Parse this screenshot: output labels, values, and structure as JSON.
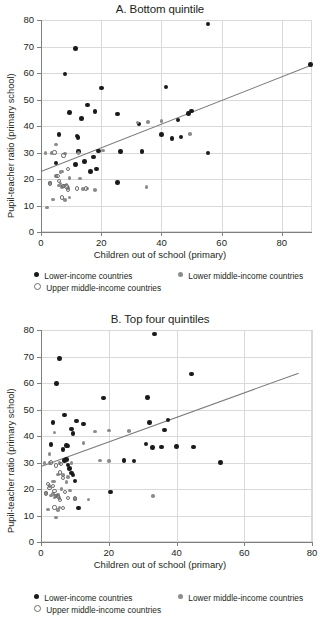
{
  "figure": {
    "legend": {
      "series": [
        {
          "key": "low",
          "label": "Lower-income countries",
          "marker": "filled-dot",
          "color": "#1a1a1a"
        },
        {
          "key": "lowmid",
          "label": "Lower middle-income countries",
          "marker": "gray-dot",
          "color": "#8c8c8c"
        },
        {
          "key": "uppermid",
          "label": "Upper middle-income countries",
          "marker": "open-circle",
          "color": "#6e6e6e"
        }
      ]
    }
  },
  "chart_data": [
    {
      "type": "scatter",
      "title": "A. Bottom quintile",
      "xlabel": "Children out of school (primary)",
      "ylabel": "Pupil-teacher ratio (primary school)",
      "xlim": [
        0,
        90
      ],
      "ylim": [
        0,
        80
      ],
      "xticks": [
        0,
        20,
        40,
        60,
        80
      ],
      "yticks": [
        0,
        10,
        20,
        30,
        40,
        50,
        60,
        70,
        80
      ],
      "grid": true,
      "legend_position": "below",
      "trendline": {
        "x0": 0,
        "y0": 23.2,
        "x1": 90,
        "y1": 63.4
      },
      "series": [
        {
          "name": "Lower-income countries",
          "color": "#1a1a1a",
          "points": [
            [
              55.5,
              78.5
            ],
            [
              11.5,
              69.3
            ],
            [
              8.0,
              59.6
            ],
            [
              20.0,
              54.3
            ],
            [
              41.5,
              54.7
            ],
            [
              89.5,
              63.3
            ],
            [
              15.5,
              48.0
            ],
            [
              9.5,
              45.2
            ],
            [
              18.0,
              45.5
            ],
            [
              25.5,
              44.5
            ],
            [
              13.5,
              42.8
            ],
            [
              32.5,
              40.8
            ],
            [
              49.0,
              44.8
            ],
            [
              50.0,
              45.7
            ],
            [
              45.5,
              42.2
            ],
            [
              6.0,
              36.8
            ],
            [
              12.0,
              36.3
            ],
            [
              12.3,
              35.6
            ],
            [
              40.0,
              36.8
            ],
            [
              43.5,
              35.3
            ],
            [
              46.5,
              35.8
            ],
            [
              55.5,
              29.8
            ],
            [
              5.0,
              26.0
            ],
            [
              11.5,
              25.5
            ],
            [
              14.5,
              26.7
            ],
            [
              17.5,
              28.3
            ],
            [
              12.5,
              30.3
            ],
            [
              19.0,
              30.5
            ],
            [
              26.5,
              30.3
            ],
            [
              33.5,
              30.3
            ],
            [
              16.5,
              22.9
            ],
            [
              18.5,
              23.7
            ],
            [
              25.5,
              18.6
            ]
          ]
        },
        {
          "name": "Lower middle-income countries",
          "color": "#8c8c8c",
          "points": [
            [
              32.0,
              41.3
            ],
            [
              35.5,
              41.6
            ],
            [
              40.0,
              41.9
            ],
            [
              49.5,
              36.9
            ],
            [
              5.0,
              33.0
            ],
            [
              1.5,
              29.9
            ],
            [
              3.5,
              29.9
            ],
            [
              8.0,
              29.6
            ],
            [
              12.5,
              29.8
            ],
            [
              20.5,
              30.8
            ],
            [
              5.0,
              21.2
            ],
            [
              6.5,
              22.7
            ],
            [
              7.0,
              22.8
            ],
            [
              9.5,
              20.4
            ],
            [
              13.0,
              20.2
            ],
            [
              3.0,
              18.5
            ],
            [
              6.0,
              17.6
            ],
            [
              6.5,
              18.3
            ],
            [
              7.0,
              16.9
            ],
            [
              7.5,
              17.4
            ],
            [
              8.5,
              17.9
            ],
            [
              9.0,
              16.6
            ],
            [
              14.0,
              16.2
            ],
            [
              15.5,
              16.4
            ],
            [
              18.0,
              15.8
            ],
            [
              4.0,
              12.3
            ],
            [
              8.0,
              12.1
            ],
            [
              9.5,
              13.0
            ],
            [
              2.0,
              9.3
            ],
            [
              35.0,
              17.0
            ]
          ]
        },
        {
          "name": "Upper middle-income countries",
          "color": "#6e6e6e",
          "points": [
            [
              4.5,
              30.0
            ],
            [
              7.5,
              28.9
            ],
            [
              9.0,
              23.9
            ],
            [
              5.5,
              21.0
            ],
            [
              6.0,
              19.3
            ],
            [
              3.0,
              18.3
            ],
            [
              7.5,
              17.5
            ],
            [
              8.5,
              17.2
            ],
            [
              9.0,
              16.0
            ],
            [
              7.0,
              13.0
            ],
            [
              15.0,
              16.4
            ],
            [
              12.0,
              16.4
            ]
          ]
        }
      ]
    },
    {
      "type": "scatter",
      "title": "B. Top four quintiles",
      "xlabel": "Children out of school (primary)",
      "ylabel": "Pupil-teacher ratio (primary school)",
      "xlim": [
        0,
        80
      ],
      "ylim": [
        0,
        80
      ],
      "xticks": [
        0,
        20,
        40,
        60,
        80
      ],
      "yticks": [
        0,
        10,
        20,
        30,
        40,
        50,
        60,
        70,
        80
      ],
      "grid": true,
      "legend_position": "below",
      "trendline": {
        "x0": 0,
        "y0": 28.8,
        "x1": 76.0,
        "y1": 64.0
      },
      "series": [
        {
          "name": "Lower-income countries",
          "color": "#1a1a1a",
          "points": [
            [
              33.5,
              78.5
            ],
            [
              5.5,
              69.3
            ],
            [
              4.5,
              59.9
            ],
            [
              44.5,
              63.4
            ],
            [
              18.5,
              54.3
            ],
            [
              31.5,
              54.6
            ],
            [
              7.0,
              48.0
            ],
            [
              3.5,
              45.2
            ],
            [
              10.5,
              45.7
            ],
            [
              12.5,
              44.6
            ],
            [
              32.0,
              45.2
            ],
            [
              37.5,
              46.0
            ],
            [
              9.0,
              42.7
            ],
            [
              9.5,
              41.0
            ],
            [
              36.5,
              42.2
            ],
            [
              3.0,
              36.8
            ],
            [
              7.5,
              36.5
            ],
            [
              8.0,
              36.2
            ],
            [
              31.0,
              37.0
            ],
            [
              33.0,
              35.6
            ],
            [
              40.0,
              36.1
            ],
            [
              53.0,
              30.1
            ],
            [
              24.5,
              30.7
            ],
            [
              27.5,
              30.5
            ],
            [
              35.5,
              35.8
            ],
            [
              45.0,
              35.8
            ],
            [
              7.0,
              30.7
            ],
            [
              8.0,
              29.0
            ],
            [
              8.5,
              27.7
            ],
            [
              9.0,
              26.0
            ],
            [
              9.5,
              25.3
            ],
            [
              10.0,
              23.0
            ],
            [
              7.5,
              31.2
            ],
            [
              11.0,
              12.9
            ],
            [
              20.5,
              18.8
            ],
            [
              6.5,
              34.9
            ]
          ]
        },
        {
          "name": "Lower middle-income countries",
          "color": "#8c8c8c",
          "points": [
            [
              4.0,
              41.3
            ],
            [
              16.0,
              41.7
            ],
            [
              20.0,
              42.0
            ],
            [
              26.0,
              41.8
            ],
            [
              12.5,
              37.4
            ],
            [
              2.5,
              33.2
            ],
            [
              1.0,
              29.9
            ],
            [
              2.5,
              29.9
            ],
            [
              5.5,
              29.7
            ],
            [
              9.0,
              29.8
            ],
            [
              17.5,
              30.7
            ],
            [
              20.0,
              30.5
            ],
            [
              2.5,
              21.1
            ],
            [
              3.5,
              22.9
            ],
            [
              4.0,
              22.9
            ],
            [
              5.0,
              25.5
            ],
            [
              6.5,
              25.3
            ],
            [
              8.0,
              24.5
            ],
            [
              7.5,
              22.6
            ],
            [
              1.5,
              18.4
            ],
            [
              3.0,
              17.5
            ],
            [
              3.5,
              18.2
            ],
            [
              4.0,
              16.8
            ],
            [
              4.5,
              17.3
            ],
            [
              5.0,
              17.8
            ],
            [
              5.5,
              16.5
            ],
            [
              10.0,
              16.3
            ],
            [
              14.0,
              16.0
            ],
            [
              2.0,
              12.3
            ],
            [
              5.0,
              12.0
            ],
            [
              5.5,
              13.0
            ],
            [
              4.5,
              9.3
            ],
            [
              33.0,
              17.3
            ],
            [
              6.0,
              20.0
            ],
            [
              8.5,
              19.5
            ]
          ]
        },
        {
          "name": "Upper middle-income countries",
          "color": "#6e6e6e",
          "points": [
            [
              3.0,
              30.0
            ],
            [
              4.5,
              28.9
            ],
            [
              6.5,
              24.0
            ],
            [
              3.5,
              21.0
            ],
            [
              4.0,
              19.3
            ],
            [
              1.5,
              18.3
            ],
            [
              4.5,
              17.5
            ],
            [
              5.0,
              17.2
            ],
            [
              5.5,
              16.0
            ],
            [
              4.0,
              13.0
            ],
            [
              10.0,
              16.4
            ],
            [
              8.0,
              16.5
            ],
            [
              7.0,
              19.0
            ],
            [
              5.5,
              26.2
            ],
            [
              6.0,
              29.5
            ],
            [
              2.0,
              22.0
            ],
            [
              2.5,
              20.5
            ],
            [
              6.5,
              12.8
            ]
          ]
        }
      ]
    }
  ]
}
